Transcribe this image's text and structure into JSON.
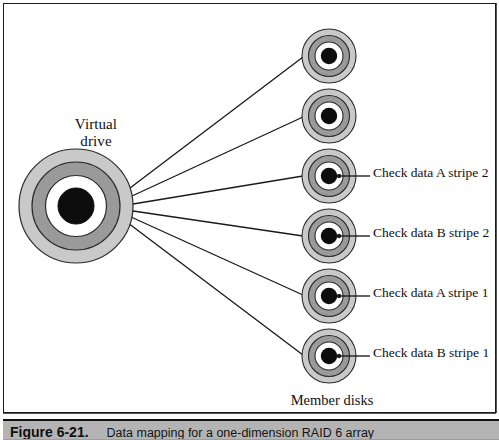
{
  "figure": {
    "virtual_drive_label_line1": "Virtual",
    "virtual_drive_label_line2": "drive",
    "member_disks_label": "Member disks",
    "caption_figure_number": "Figure 6-21.",
    "caption_title": "Data mapping for a one-dimension RAID 6 array",
    "colors": {
      "disk_outer_ring": "#c9c9c9",
      "disk_mid_ring": "#9a9a9a",
      "disk_white_ring": "#ffffff",
      "disk_center": "#0d0d0d",
      "outline": "#222222",
      "connector_line": "#1a1a1a",
      "caption_bar_bg": "#b4b4b4",
      "page_bg": "#ffffff"
    },
    "virtual_drive": {
      "cx": 72,
      "cy": 202,
      "r_outer": 58,
      "r_mid": 45,
      "r_white": 31,
      "r_center": 18
    },
    "member_disks": [
      {
        "id": "member-disk-1",
        "cx": 325,
        "cy": 52,
        "r_outer": 28,
        "label": ""
      },
      {
        "id": "member-disk-2",
        "cx": 325,
        "cy": 112,
        "r_outer": 28,
        "label": ""
      },
      {
        "id": "member-disk-3",
        "cx": 325,
        "cy": 172,
        "r_outer": 28,
        "label": "Check data A stripe 2"
      },
      {
        "id": "member-disk-4",
        "cx": 325,
        "cy": 232,
        "r_outer": 28,
        "label": "Check data B stripe 2"
      },
      {
        "id": "member-disk-5",
        "cx": 325,
        "cy": 292,
        "r_outer": 28,
        "label": "Check data A stripe 1"
      },
      {
        "id": "member-disk-6",
        "cx": 325,
        "cy": 352,
        "r_outer": 28,
        "label": "Check data B stripe 1"
      }
    ],
    "stripe_labels": {
      "check_a_stripe_2": "Check data A stripe 2",
      "check_b_stripe_2": "Check data B stripe 2",
      "check_a_stripe_1": "Check data A stripe 1",
      "check_b_stripe_1": "Check data B stripe 1"
    }
  }
}
